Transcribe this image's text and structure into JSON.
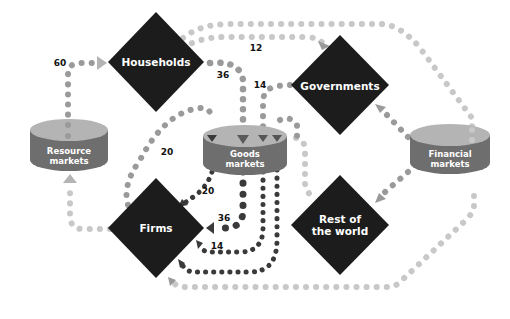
{
  "diagram": {
    "type": "circular-flow-of-income",
    "nodes": {
      "households": {
        "label": "Households",
        "shape": "diamond"
      },
      "governments": {
        "label": "Governments",
        "shape": "diamond"
      },
      "firms": {
        "label": "Firms",
        "shape": "diamond"
      },
      "rest_of_world": {
        "label_line1": "Rest of",
        "label_line2": "the world",
        "shape": "diamond"
      },
      "resource_markets": {
        "label_line1": "Resource",
        "label_line2": "markets",
        "shape": "cylinder"
      },
      "goods_markets": {
        "label_line1": "Goods",
        "label_line2": "markets",
        "shape": "cylinder"
      },
      "financial_markets": {
        "label_line1": "Financial",
        "label_line2": "markets",
        "shape": "cylinder"
      }
    },
    "flows": [
      {
        "from": "resource_markets",
        "to": "households",
        "value": "60",
        "color": "medium-gray"
      },
      {
        "from": "households",
        "to": "governments",
        "value": "12",
        "color": "light-gray"
      },
      {
        "from": "households",
        "to": "financial_markets",
        "value": "",
        "color": "light-gray"
      },
      {
        "from": "households",
        "to": "goods_markets",
        "value": "36",
        "color": "medium-gray"
      },
      {
        "from": "governments",
        "to": "goods_markets",
        "value": "14",
        "color": "medium-gray"
      },
      {
        "from": "firms",
        "to": "goods_markets",
        "value": "20",
        "color": "medium-gray"
      },
      {
        "from": "goods_markets",
        "to": "firms",
        "value": "20",
        "color": "dark-gray"
      },
      {
        "from": "goods_markets",
        "to": "firms",
        "value": "36",
        "color": "dark-gray"
      },
      {
        "from": "goods_markets",
        "to": "firms",
        "value": "14",
        "color": "dark-gray"
      },
      {
        "from": "goods_markets",
        "to": "firms",
        "value": "",
        "color": "dark-gray"
      },
      {
        "from": "goods_markets",
        "to": "rest_of_world",
        "value": "",
        "color": "light-gray"
      },
      {
        "from": "firms",
        "to": "resource_markets",
        "value": "",
        "color": "light-gray"
      },
      {
        "from": "financial_markets",
        "to": "governments",
        "value": "",
        "color": "medium-gray"
      },
      {
        "from": "financial_markets",
        "to": "rest_of_world",
        "value": "",
        "color": "medium-gray"
      },
      {
        "from": "financial_markets",
        "to": "firms",
        "value": "",
        "color": "light-gray"
      }
    ],
    "flow_labels": {
      "resource_to_households": "60",
      "households_to_governments": "12",
      "households_to_goods": "36",
      "governments_to_goods": "14",
      "firms_to_goods": "20",
      "goods_to_firms_a": "20",
      "goods_to_firms_b": "36",
      "goods_to_firms_c": "14"
    },
    "colors": {
      "diamond_fill": "#1c1c1c",
      "cylinder_top": "#b4b4b4",
      "cylinder_side": "#6e6e6e",
      "dot_light": "#c8c8c8",
      "dot_medium": "#9a9a9a",
      "dot_dark": "#3a3a3a",
      "label_text": "#111111",
      "node_text": "#ffffff"
    }
  }
}
